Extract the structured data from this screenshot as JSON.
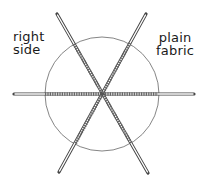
{
  "labels": {
    "left": {
      "line1": "right",
      "line2": "side"
    },
    "right": {
      "line1": "plain",
      "line2": "fabric"
    }
  },
  "diagram": {
    "center": [
      102,
      94
    ],
    "circle_radius": 57,
    "spokes": 3,
    "stroke_color": "#555555",
    "stitch_color": "#777777"
  }
}
